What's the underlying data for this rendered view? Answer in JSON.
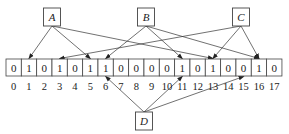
{
  "diagram": {
    "type": "hash-bitarray",
    "bits": [
      0,
      1,
      0,
      1,
      0,
      1,
      1,
      0,
      0,
      0,
      0,
      1,
      0,
      1,
      0,
      0,
      1,
      0
    ],
    "indices": [
      "0",
      "1",
      "2",
      "3",
      "4",
      "5",
      "6",
      "7",
      "8",
      "9",
      "10",
      "11",
      "12",
      "13",
      "14",
      "15",
      "16",
      "17"
    ],
    "nodes": [
      {
        "id": "A",
        "label": "A",
        "position": "top",
        "targets": [
          1,
          5,
          13
        ]
      },
      {
        "id": "B",
        "label": "B",
        "position": "top",
        "targets": [
          6,
          11,
          16
        ]
      },
      {
        "id": "C",
        "label": "C",
        "position": "top",
        "targets": [
          3,
          13,
          16
        ]
      },
      {
        "id": "D",
        "label": "D",
        "position": "bottom",
        "targets": [
          6,
          11,
          15
        ]
      }
    ],
    "colors": {
      "stroke": "#444444",
      "text": "#222222",
      "background": "#ffffff"
    }
  }
}
